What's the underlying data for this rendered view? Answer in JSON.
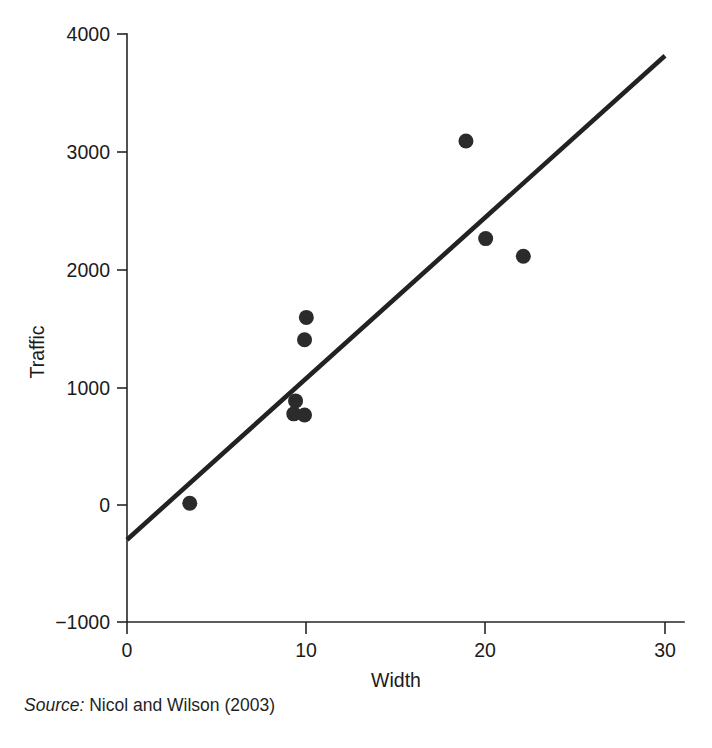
{
  "figure": {
    "source_label": "Source:",
    "source_text": "Nicol and Wilson (2003)",
    "marker_color": "#2b2b2b",
    "line_color": "#222222",
    "axis_color": "#262626",
    "background": "#ffffff"
  },
  "chart_data": {
    "type": "scatter",
    "title": "",
    "xlabel": "Width",
    "ylabel": "Traffic",
    "xlim": [
      0,
      30
    ],
    "ylim": [
      -1000,
      4000
    ],
    "xticks": [
      0,
      10,
      20,
      30
    ],
    "xtick_labels": [
      "0",
      "10",
      "20",
      "30"
    ],
    "yticks": [
      -1000,
      0,
      1000,
      2000,
      3000,
      4000
    ],
    "ytick_labels": [
      "−1000",
      "0",
      "1000",
      "2000",
      "3000",
      "4000"
    ],
    "grid": false,
    "legend": false,
    "points": [
      {
        "x": 3.5,
        "y": 10
      },
      {
        "x": 9.4,
        "y": 880
      },
      {
        "x": 9.3,
        "y": 770
      },
      {
        "x": 9.9,
        "y": 760
      },
      {
        "x": 10.0,
        "y": 1590
      },
      {
        "x": 9.9,
        "y": 1400
      },
      {
        "x": 18.9,
        "y": 3090
      },
      {
        "x": 20.0,
        "y": 2260
      },
      {
        "x": 22.1,
        "y": 2110
      }
    ],
    "marker_radius_px": 7.5,
    "fit_line": {
      "label": "regression line",
      "x_start": 0,
      "y_start": -300,
      "x_end": 30,
      "y_end": 3815,
      "slope": 137.2,
      "intercept": -300
    }
  }
}
